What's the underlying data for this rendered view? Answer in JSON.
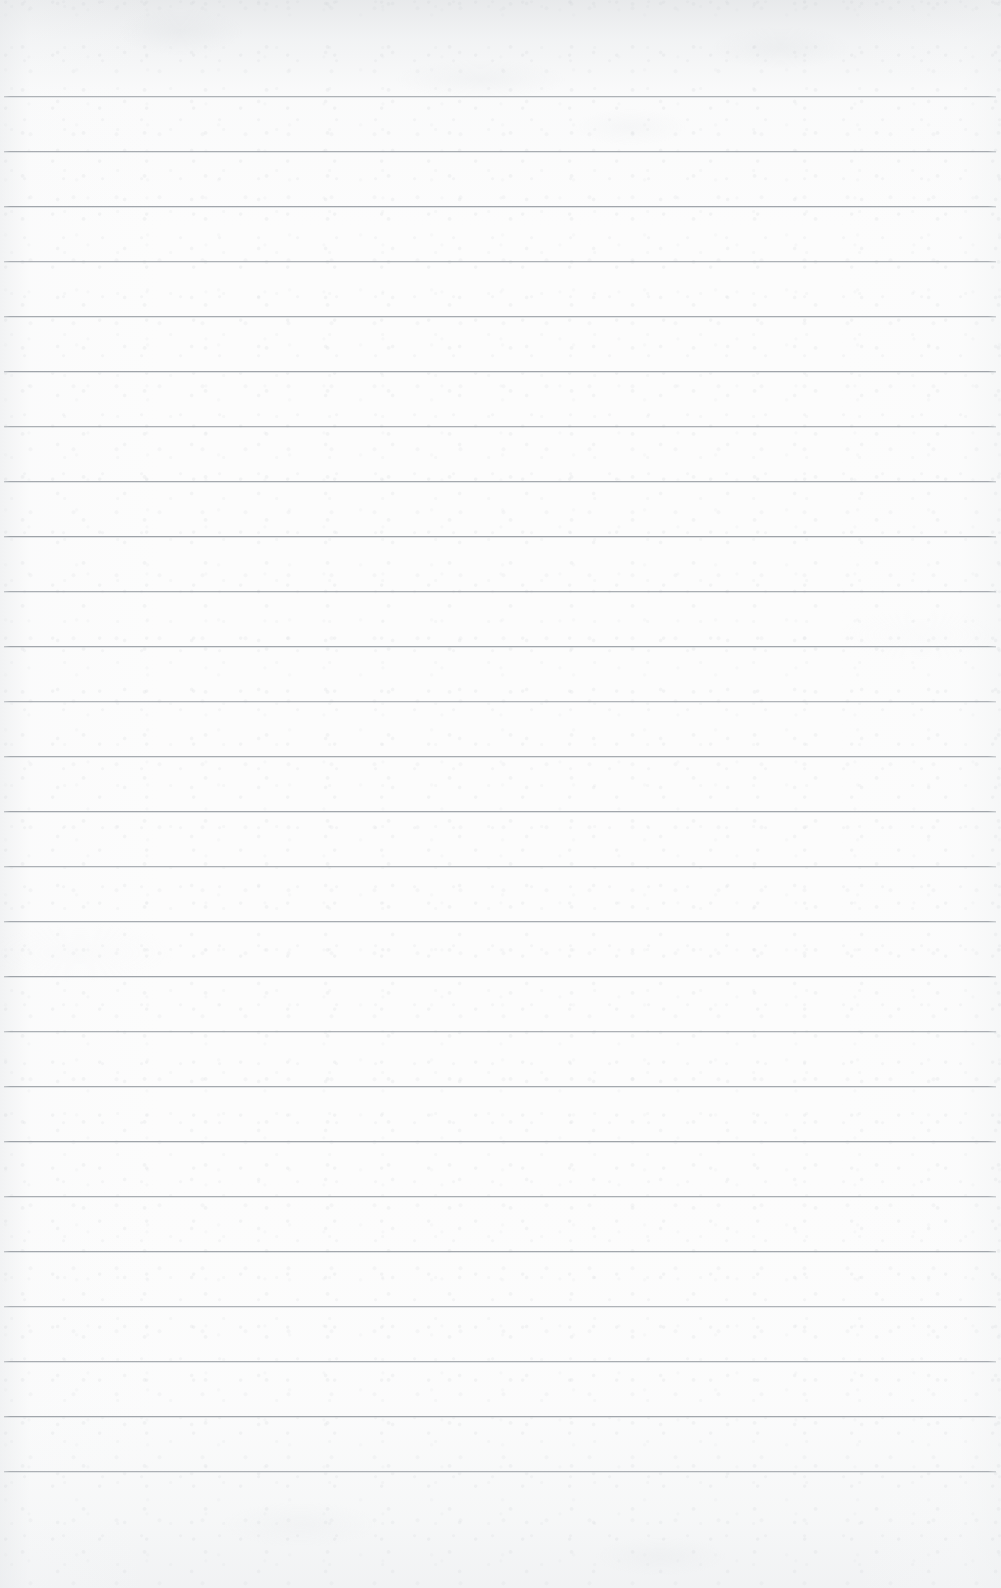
{
  "document": {
    "kind": "lined-notebook-paper-scan",
    "title": "Blank ruled notepad page",
    "orientation": "portrait",
    "page_width_px": 1001,
    "page_height_px": 1588,
    "has_text_content": false,
    "has_handwriting": false,
    "has_margin_rule": false,
    "has_holes": false
  },
  "colors": {
    "paper": "#fcfcfc",
    "paper_top_shade": "#e9ebed",
    "paper_bottom_shade": "#eef0f1",
    "rule_line": "#969ba1",
    "rule_highlight": "#d6dade",
    "grain": "#c8ccd0"
  },
  "ruling": {
    "line_count": 26,
    "first_line_y": 96,
    "line_spacing_px": 55,
    "line_thickness_px": 1,
    "line_start_x": 4,
    "line_end_x": 996,
    "lines_y": [
      96,
      151,
      206,
      261,
      316,
      371,
      426,
      481,
      536,
      591,
      646,
      701,
      756,
      811,
      866,
      921,
      976,
      1031,
      1086,
      1141,
      1196,
      1251,
      1306,
      1361,
      1416,
      1471
    ]
  },
  "margins": {
    "top_blank_px": 96,
    "bottom_blank_px": 117,
    "left_px": 4,
    "right_px": 5
  }
}
